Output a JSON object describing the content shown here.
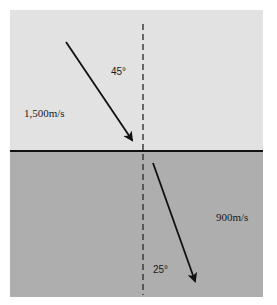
{
  "diagram": {
    "type": "refraction",
    "media": [
      {
        "name": "upper-medium",
        "velocity_label": "1,500m/s",
        "color": "#e2e2e2"
      },
      {
        "name": "lower-medium",
        "velocity_label": "900m/s",
        "color": "#aeaeae"
      }
    ],
    "incident_angle_label": "45°",
    "refracted_angle_label": "25°",
    "interface_color": "#111111",
    "normal_line_style": "dashed"
  }
}
